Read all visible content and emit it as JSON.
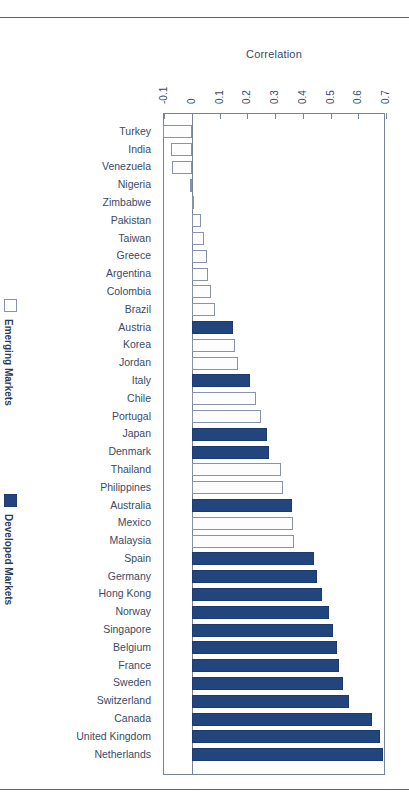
{
  "chart_data": {
    "type": "bar",
    "orientation": "horizontal",
    "title": "",
    "xlabel": "Correlation",
    "ylabel": "",
    "xlim": [
      -0.1,
      0.7
    ],
    "xticks": [
      -0.1,
      0,
      0.1,
      0.2,
      0.3,
      0.4,
      0.5,
      0.6,
      0.7
    ],
    "xtick_labels": [
      "-0.1",
      "0",
      "0.1",
      "0.2",
      "0.3",
      "0.4",
      "0.5",
      "0.6",
      "0.7"
    ],
    "grid": false,
    "legend_position": "left-outside",
    "series": [
      {
        "name": "Emerging Markets",
        "color": "#ffffff",
        "border": "#8892a8"
      },
      {
        "name": "Developed Markets",
        "color": "#23457e",
        "border": "#1d3a6c"
      }
    ],
    "categories": [
      "Turkey",
      "India",
      "Venezuela",
      "Nigeria",
      "Zimbabwe",
      "Pakistan",
      "Taiwan",
      "Greece",
      "Argentina",
      "Colombia",
      "Brazil",
      "Austria",
      "Korea",
      "Jordan",
      "Italy",
      "Chile",
      "Portugal",
      "Japan",
      "Denmark",
      "Thailand",
      "Philippines",
      "Australia",
      "Mexico",
      "Malaysia",
      "Spain",
      "Germany",
      "Hong Kong",
      "Norway",
      "Singapore",
      "Belgium",
      "France",
      "Sweden",
      "Switzerland",
      "Canada",
      "United Kingdom",
      "Netherlands"
    ],
    "values": [
      -0.105,
      -0.075,
      -0.072,
      -0.005,
      0.005,
      0.035,
      0.045,
      0.055,
      0.06,
      0.07,
      0.085,
      0.15,
      0.155,
      0.165,
      0.21,
      0.23,
      0.25,
      0.27,
      0.28,
      0.32,
      0.33,
      0.36,
      0.365,
      0.37,
      0.44,
      0.45,
      0.47,
      0.495,
      0.51,
      0.525,
      0.53,
      0.545,
      0.565,
      0.65,
      0.68,
      0.69
    ],
    "groups": [
      "Emerging Markets",
      "Emerging Markets",
      "Emerging Markets",
      "Emerging Markets",
      "Emerging Markets",
      "Emerging Markets",
      "Emerging Markets",
      "Emerging Markets",
      "Emerging Markets",
      "Emerging Markets",
      "Emerging Markets",
      "Developed Markets",
      "Emerging Markets",
      "Emerging Markets",
      "Developed Markets",
      "Emerging Markets",
      "Emerging Markets",
      "Developed Markets",
      "Developed Markets",
      "Emerging Markets",
      "Emerging Markets",
      "Developed Markets",
      "Emerging Markets",
      "Emerging Markets",
      "Developed Markets",
      "Developed Markets",
      "Developed Markets",
      "Developed Markets",
      "Developed Markets",
      "Developed Markets",
      "Developed Markets",
      "Developed Markets",
      "Developed Markets",
      "Developed Markets",
      "Developed Markets",
      "Developed Markets"
    ]
  },
  "legend": {
    "emerging": {
      "label": "Emerging Markets",
      "swatch": "open-square-swatch"
    },
    "developed": {
      "label": "Developed Markets",
      "swatch": "filled-square-swatch"
    }
  },
  "colors": {
    "developed": "#23457e",
    "emerging": "#ffffff",
    "axis": "#76839b",
    "text": "#3b4a66",
    "rule": "#55647f"
  }
}
